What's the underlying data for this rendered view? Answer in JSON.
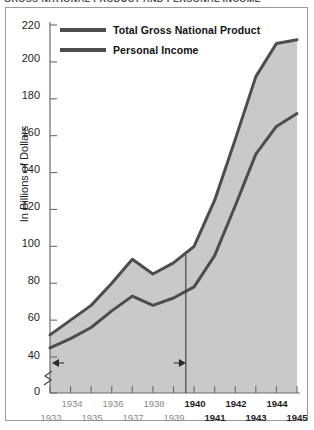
{
  "title": {
    "text": "GROSS NATIONAL PRODUCT AND PERSONAL INCOME",
    "note": "clipped at top edge"
  },
  "axes": {
    "ylabel": "In Billions of Dollars",
    "yticks": [
      "0",
      "40",
      "60",
      "80",
      "100",
      "120",
      "140",
      "160",
      "180",
      "200",
      "220"
    ],
    "xticks_upper": [
      "1934",
      "1936",
      "1938",
      "1940",
      "1942",
      "1944"
    ],
    "xticks_lower": [
      "1933",
      "1935",
      "1937",
      "1939",
      "1941",
      "1943",
      "1945"
    ]
  },
  "legend": {
    "items": [
      {
        "label": "Total Gross National Product",
        "color": "#4d4d4d"
      },
      {
        "label": "Personal Income",
        "color": "#4d4d4d"
      }
    ]
  },
  "annotation": {
    "label": "The Great Depression",
    "left_arrow": "left-arrow-icon",
    "right_arrow": "right-arrow-icon",
    "end_year": 1939.6
  },
  "chart_data": {
    "type": "line",
    "title": "GROSS NATIONAL PRODUCT AND PERSONAL INCOME",
    "xlabel": "",
    "ylabel": "In Billions of Dollars",
    "ylim": [
      0,
      220
    ],
    "y_axis_break": [
      0,
      40
    ],
    "xlim": [
      1933,
      1945
    ],
    "grid": false,
    "legend_position": "top-left-inside",
    "area_fill": "#c9c9c9",
    "x": [
      1933,
      1934,
      1935,
      1936,
      1937,
      1938,
      1939,
      1940,
      1941,
      1942,
      1943,
      1944,
      1945
    ],
    "series": [
      {
        "name": "Total Gross National Product",
        "color": "#4d4d4d",
        "values": [
          52,
          60,
          68,
          80,
          93,
          85,
          91,
          100,
          125,
          158,
          192,
          210,
          212
        ]
      },
      {
        "name": "Personal Income",
        "color": "#4d4d4d",
        "values": [
          45,
          50,
          56,
          65,
          73,
          68,
          72,
          78,
          95,
          122,
          150,
          165,
          172
        ]
      }
    ],
    "annotations": [
      {
        "text": "The Great Depression",
        "type": "span-arrow",
        "x_start": 1933,
        "x_end": 1939.6,
        "y": 40
      }
    ]
  }
}
